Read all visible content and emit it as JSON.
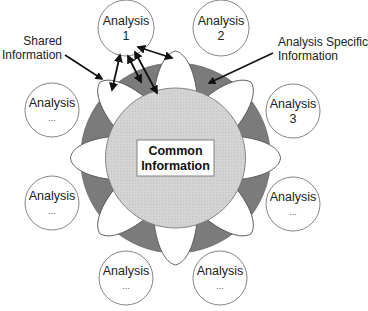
{
  "diagram": {
    "center_label": [
      "Common",
      "Information"
    ],
    "annotations": {
      "shared": [
        "Shared",
        "Information"
      ],
      "specific": [
        "Analysis Specific",
        "Information"
      ]
    },
    "analyses": [
      {
        "title": "Analysis",
        "sub": "1"
      },
      {
        "title": "Analysis",
        "sub": "2"
      },
      {
        "title": "Analysis",
        "sub": "3"
      },
      {
        "title": "Analysis",
        "sub": "..."
      },
      {
        "title": "Analysis",
        "sub": "..."
      },
      {
        "title": "Analysis",
        "sub": "..."
      },
      {
        "title": "Analysis",
        "sub": "..."
      },
      {
        "title": "Analysis",
        "sub": "..."
      }
    ],
    "colors": {
      "ring": "#7b7b7b",
      "core": "#d2d2d2",
      "petal": "#ffffff",
      "stroke": "#666666",
      "arrow": "#111111"
    }
  }
}
